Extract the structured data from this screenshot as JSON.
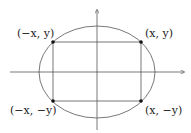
{
  "diagram": {
    "type": "ellipse-inscribed-rectangle",
    "labels": {
      "top_left": "(−x, y)",
      "top_right": "(x, y)",
      "bottom_left": "(−x, −y)",
      "bottom_right": "(x, −y)"
    },
    "colors": {
      "axis": "#555555",
      "ellipse": "#555555",
      "rectangle": "#555555",
      "points": "#111111",
      "text": "#222222"
    }
  }
}
